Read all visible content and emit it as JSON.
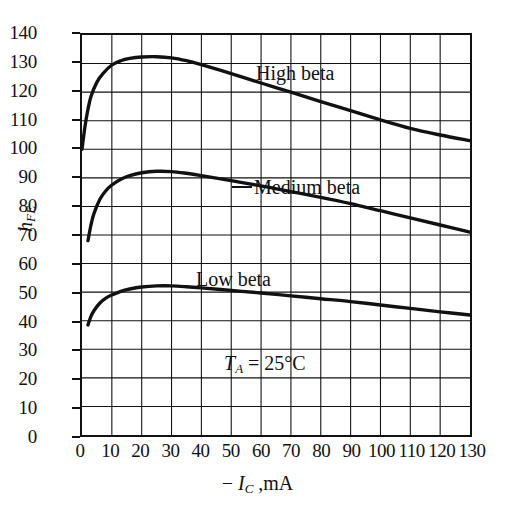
{
  "figure": {
    "background": "#ffffff",
    "ink_color": "#111111"
  },
  "chart_data": {
    "type": "line",
    "title": "",
    "xlabel": "− I_C , mA",
    "ylabel": "h_FE",
    "xlim": [
      0,
      130
    ],
    "ylim": [
      0,
      140
    ],
    "xticks": [
      0,
      10,
      20,
      30,
      40,
      50,
      60,
      70,
      80,
      90,
      100,
      110,
      120,
      130
    ],
    "yticks": [
      0,
      10,
      20,
      30,
      40,
      50,
      60,
      70,
      80,
      90,
      100,
      110,
      120,
      130,
      140
    ],
    "grid": true,
    "grid_spacing_x": 10,
    "grid_spacing_y": 10,
    "legend": "inline-annotations",
    "annotations": [
      {
        "text": "High beta",
        "x": 57,
        "y": 124
      },
      {
        "text": "Medium beta",
        "x": 57,
        "y": 86
      },
      {
        "text": "Low beta",
        "x": 38,
        "y": 55
      },
      {
        "text": "T_A = 25°C",
        "x": 47,
        "y": 26
      }
    ],
    "series": [
      {
        "name": "High beta",
        "x": [
          0,
          1,
          2,
          3,
          5,
          7,
          10,
          13,
          16,
          20,
          25,
          30,
          35,
          40,
          50,
          60,
          70,
          80,
          90,
          100,
          110,
          120,
          130
        ],
        "y": [
          100,
          108,
          114,
          118.5,
          123.5,
          126.5,
          129.5,
          131,
          131.8,
          132.3,
          132.4,
          132,
          131,
          129.6,
          126.5,
          123.2,
          120,
          116.7,
          113.5,
          110.3,
          107.3,
          105,
          103
        ]
      },
      {
        "name": "Medium beta",
        "x": [
          2,
          3,
          4,
          6,
          8,
          10,
          13,
          16,
          20,
          25,
          30,
          35,
          40,
          50,
          60,
          70,
          80,
          90,
          100,
          110,
          120,
          130
        ],
        "y": [
          68,
          73.5,
          77.5,
          82.5,
          85.5,
          87.5,
          89.5,
          90.8,
          91.8,
          92.3,
          92.2,
          91.6,
          90.8,
          89,
          87.2,
          85.2,
          83.2,
          81,
          78.5,
          76,
          73.5,
          71
        ]
      },
      {
        "name": "Low beta",
        "x": [
          2,
          3,
          4,
          6,
          8,
          10,
          13,
          16,
          20,
          25,
          30,
          35,
          40,
          50,
          60,
          70,
          80,
          90,
          100,
          110,
          120,
          130
        ],
        "y": [
          38.5,
          41.5,
          43.5,
          46.2,
          47.9,
          49,
          50.3,
          51.1,
          51.8,
          52.2,
          52.2,
          51.9,
          51.5,
          50.6,
          49.7,
          48.7,
          47.7,
          46.7,
          45.5,
          44.3,
          43.1,
          42
        ]
      }
    ]
  },
  "axis": {
    "y_label_parts": {
      "main": "h",
      "sub": "FE"
    },
    "x_label_parts": {
      "minus": "−",
      "symbol": "I",
      "sub": "C",
      "unit": ",mA"
    }
  },
  "labels": {
    "high_beta": "High beta",
    "medium_beta": "Medium beta",
    "low_beta": "Low beta",
    "temp_symbol": "T",
    "temp_sub": "A",
    "temp_value": "= 25°C"
  }
}
